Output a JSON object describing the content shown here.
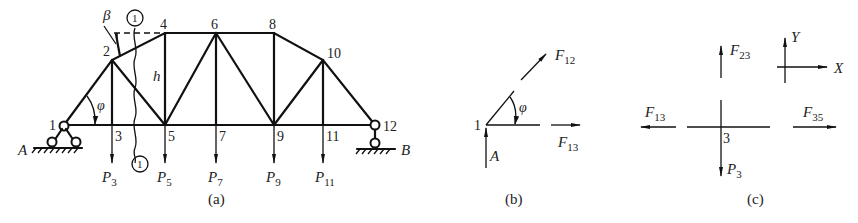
{
  "figure_a": {
    "caption": "(a)",
    "nodes": [
      "1",
      "2",
      "3",
      "4",
      "5",
      "6",
      "7",
      "8",
      "9",
      "10",
      "11",
      "12"
    ],
    "node_labels": {
      "n1": "1",
      "n2": "2",
      "n3": "3",
      "n4": "4",
      "n5": "5",
      "n6": "6",
      "n7": "7",
      "n8": "8",
      "n9": "9",
      "n10": "10",
      "n11": "11",
      "n12": "12"
    },
    "supports": {
      "left": "A",
      "right": "B"
    },
    "height_label": "h",
    "angle_labels": {
      "phi": "φ",
      "beta": "β"
    },
    "section_marker": "1",
    "loads": [
      {
        "node": "3",
        "symbol": "P",
        "sub": "3"
      },
      {
        "node": "5",
        "symbol": "P",
        "sub": "5"
      },
      {
        "node": "7",
        "symbol": "P",
        "sub": "7"
      },
      {
        "node": "9",
        "symbol": "P",
        "sub": "9"
      },
      {
        "node": "11",
        "symbol": "P",
        "sub": "11"
      }
    ]
  },
  "figure_b": {
    "caption": "(b)",
    "node_label": "1",
    "support_label": "A",
    "angle_label": "φ",
    "forces": [
      {
        "symbol": "F",
        "sub": "12"
      },
      {
        "symbol": "F",
        "sub": "13"
      }
    ]
  },
  "figure_c": {
    "caption": "(c)",
    "node_label": "3",
    "forces": [
      {
        "symbol": "F",
        "sub": "23"
      },
      {
        "symbol": "F",
        "sub": "13"
      },
      {
        "symbol": "F",
        "sub": "35"
      },
      {
        "symbol": "P",
        "sub": "3"
      }
    ],
    "axes": {
      "x": "X",
      "y": "Y"
    }
  }
}
